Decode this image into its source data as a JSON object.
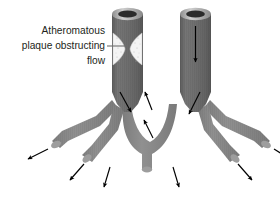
{
  "figure": {
    "background_color": "#ffffff"
  },
  "callout": {
    "name": "plaque-callout",
    "lines": [
      "Atheromatous",
      "plaque obstructing",
      "flow"
    ],
    "text_color": "#231f20",
    "leader_line_color": "#6e6e6e"
  },
  "colors": {
    "vessel_trunk": "#6e6e6e",
    "vessel_trunk_shade": "#5f5f5f",
    "vessel_branch": "#8a8a8a",
    "vessel_rim": "#9a9a9a",
    "vessel_rim_highlight": "#c9c9c9",
    "lumen_opening": "#2b2b2b",
    "plaque": "#f2f2f2",
    "plaque_speckle": "#b8b8b8",
    "arrow": "#000000",
    "outline": "#4a4a4a"
  },
  "vessels": {
    "left_trunk": {
      "name": "left-artery-trunk",
      "label": "Obstructed artery with atheromatous plaque",
      "has_plaque": true
    },
    "right_trunk": {
      "name": "right-artery-trunk",
      "label": "Patent artery with normal flow",
      "has_plaque": false
    },
    "collateral_arch": {
      "name": "collateral-arch",
      "label": "Collateral connection between arterial beds"
    }
  },
  "plaque": {
    "name": "atheromatous-plaque",
    "label": "Atheromatous plaque",
    "shape": "hourglass-narrowing"
  },
  "flow_arrows": [
    {
      "name": "flow-arrow-left-trunk",
      "direction": "down-right",
      "label": "Reduced flow past plaque"
    },
    {
      "name": "flow-arrow-right-trunk",
      "direction": "down",
      "label": "Normal antegrade flow"
    },
    {
      "name": "flow-arrow-right-branch",
      "direction": "down-left",
      "label": "Antegrade branch flow"
    },
    {
      "name": "flow-arrow-collateral-upper-left",
      "direction": "up-left",
      "label": "Retrograde collateral flow"
    },
    {
      "name": "flow-arrow-collateral-lower",
      "direction": "up-left",
      "label": "Retrograde collateral flow"
    },
    {
      "name": "flow-arrow-outflow-1",
      "direction": "down-left",
      "label": "Distal outflow"
    },
    {
      "name": "flow-arrow-outflow-2",
      "direction": "down-left",
      "label": "Distal outflow"
    },
    {
      "name": "flow-arrow-outflow-3",
      "direction": "down",
      "label": "Distal outflow"
    },
    {
      "name": "flow-arrow-outflow-4",
      "direction": "down",
      "label": "Distal outflow"
    },
    {
      "name": "flow-arrow-outflow-5",
      "direction": "down-right",
      "label": "Distal outflow"
    },
    {
      "name": "flow-arrow-outflow-6",
      "direction": "down-right",
      "label": "Distal outflow"
    }
  ]
}
